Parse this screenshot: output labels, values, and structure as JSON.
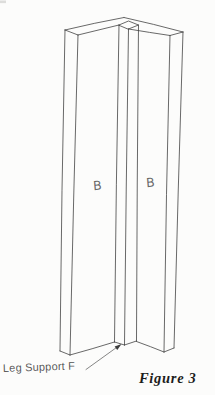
{
  "figure": {
    "caption": "Figure 3",
    "callout_label": "Leg Support F",
    "left_panel_label": "B",
    "right_panel_label": "B"
  },
  "icons": {
    "leader_arrowhead": "filled-triangle-pointing-up-right"
  },
  "colors": {
    "background": "#fcfcfb",
    "line": "#414141",
    "panel_label_text": "#4f4f4f",
    "callout_text": "#454545",
    "caption_text": "#1c1c1c"
  }
}
